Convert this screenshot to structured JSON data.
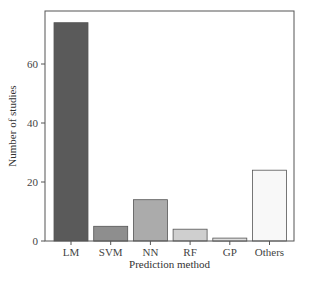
{
  "chart_data": {
    "type": "bar",
    "title": "",
    "xlabel": "Prediction method",
    "ylabel": "Number of studies",
    "categories": [
      "LM",
      "SVM",
      "NN",
      "RF",
      "GP",
      "Others"
    ],
    "values": [
      74,
      5,
      14,
      4,
      1,
      24
    ],
    "colors": [
      "#5a5a5a",
      "#8e8e8e",
      "#ababab",
      "#cfcfcf",
      "#dedede",
      "#f8f8f8"
    ],
    "yticks": [
      0,
      20,
      40,
      60
    ],
    "ylim": [
      0,
      77
    ],
    "grid": false,
    "legend": null
  }
}
